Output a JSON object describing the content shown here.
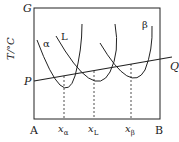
{
  "diagram": {
    "axes": {
      "y_top_label": "G",
      "y_side_label": "T/°C",
      "x_left_label": "A",
      "x_right_label": "B"
    },
    "curves": [
      {
        "name": "α",
        "label": "α"
      },
      {
        "name": "L",
        "label": "L"
      },
      {
        "name": "β",
        "label": "β"
      }
    ],
    "tangent_line": {
      "start_label": "P",
      "end_label": "Q"
    },
    "compositions": [
      {
        "symbol": "x",
        "subscript": "α"
      },
      {
        "symbol": "x",
        "subscript": "L"
      },
      {
        "symbol": "x",
        "subscript": "β"
      }
    ],
    "colors": {
      "line": "#222222",
      "background": "#ffffff"
    }
  }
}
